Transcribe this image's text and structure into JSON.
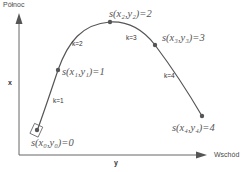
{
  "axes": {
    "north_label": "Północ",
    "east_label": "Wschód",
    "vertical_var": "x",
    "horizontal_var": "y"
  },
  "points": [
    {
      "id": "P0",
      "label": "s(x₀,y₀)=0"
    },
    {
      "id": "P1",
      "label": "s(x₁,y₁)=1"
    },
    {
      "id": "P2",
      "label": "s(x₂,y₂)=2"
    },
    {
      "id": "P3",
      "label": "s(x₃,y₃)=3"
    },
    {
      "id": "P4",
      "label": "s(x₄,y₄)=4"
    }
  ],
  "segments": [
    {
      "label": "k=1"
    },
    {
      "label": "k=2"
    },
    {
      "label": "k=3"
    },
    {
      "label": "k=4"
    }
  ],
  "colors": {
    "axis": "#555555",
    "curve": "#555555",
    "point": "#555555",
    "text": "#4a4a4a"
  }
}
